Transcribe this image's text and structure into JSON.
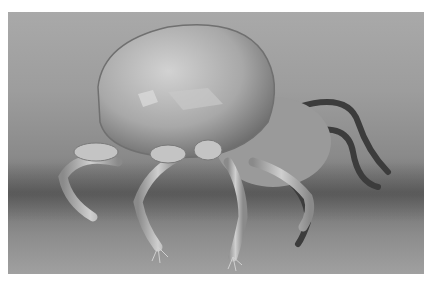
{
  "image": {
    "subject": "scanning electron micrograph of a mite",
    "colors": {
      "border": "#ffffff",
      "background_light": "#a9a9a9",
      "background_dark": "#6e6e6e",
      "body_highlight": "#d0d0d0",
      "body_shadow": "#6a6a6a",
      "leg": "#b8b8b8"
    }
  }
}
